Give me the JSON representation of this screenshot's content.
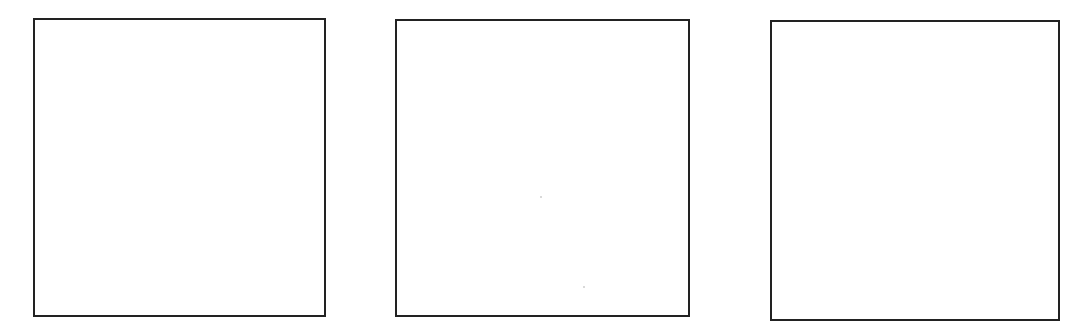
{
  "panels": [
    {
      "id": "panel-1",
      "x": 33,
      "y": 18,
      "width": 293,
      "height": 299,
      "border_color": "#222222",
      "fill": "#ffffff"
    },
    {
      "id": "panel-2",
      "x": 395,
      "y": 19,
      "width": 295,
      "height": 298,
      "border_color": "#222222",
      "fill": "#ffffff"
    },
    {
      "id": "panel-3",
      "x": 770,
      "y": 20,
      "width": 290,
      "height": 301,
      "border_color": "#222222",
      "fill": "#ffffff"
    }
  ]
}
